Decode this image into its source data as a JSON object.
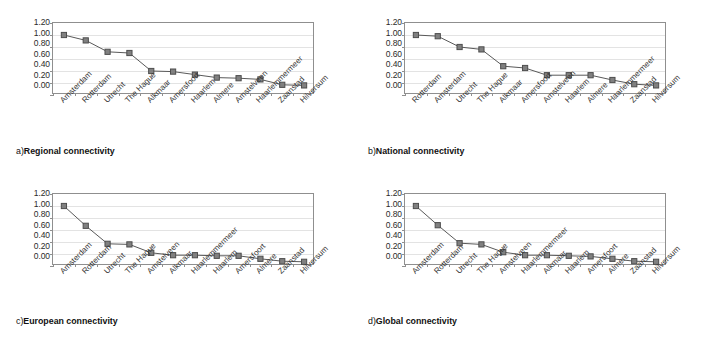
{
  "figure": {
    "marker_color": "#808080",
    "marker_edge_color": "#4d4d4d",
    "line_color": "#595959",
    "axis_color": "#8f8f8f",
    "gridline_color": "#e3e3e3",
    "background": "#ffffff"
  },
  "panels": [
    {
      "id": "panel-a",
      "caption_index": "a)",
      "caption_text": "Regional connectivity",
      "chart_data": {
        "type": "line",
        "title": "a) Regional connectivity",
        "xlabel": "",
        "ylabel": "",
        "ylim": [
          0.0,
          1.2
        ],
        "yticks": [
          "0.00",
          "0.20",
          "0.40",
          "0.60",
          "0.80",
          "1.00",
          "1.20"
        ],
        "grid": true,
        "legend": "none",
        "categories": [
          "Amsterdam",
          "Rotterdam",
          "Utrecht",
          "The Hague",
          "Alkmaar",
          "Amersfoort",
          "Haarlem",
          "Almere",
          "Amstelveen",
          "Haarlemmermeer",
          "Zaanstad",
          "Hilversum"
        ],
        "values": [
          1.0,
          0.91,
          0.72,
          0.7,
          0.4,
          0.39,
          0.34,
          0.29,
          0.28,
          0.26,
          0.17,
          0.16
        ]
      }
    },
    {
      "id": "panel-b",
      "caption_index": "b)",
      "caption_text": "National connectivity",
      "chart_data": {
        "type": "line",
        "title": "b) National connectivity",
        "xlabel": "",
        "ylabel": "",
        "ylim": [
          0.0,
          1.2
        ],
        "yticks": [
          "0.00",
          "0.20",
          "0.40",
          "0.60",
          "0.80",
          "1.00",
          "1.20"
        ],
        "grid": true,
        "legend": "none",
        "categories": [
          "Rotterdam",
          "Amsterdam",
          "Utrecht",
          "The Hague",
          "Alkmaar",
          "Amersfoort",
          "Amstelveen",
          "Haarlem",
          "Almere",
          "Haarlemmermeer",
          "Zaanstad",
          "Hilversum"
        ],
        "values": [
          1.0,
          0.98,
          0.8,
          0.76,
          0.48,
          0.45,
          0.33,
          0.33,
          0.33,
          0.25,
          0.18,
          0.16
        ]
      }
    },
    {
      "id": "panel-c",
      "caption_index": "c)",
      "caption_text": "European connectivity",
      "chart_data": {
        "type": "line",
        "title": "c) European connectivity",
        "xlabel": "",
        "ylabel": "",
        "ylim": [
          0.0,
          1.2
        ],
        "yticks": [
          "0.00",
          "0.20",
          "0.40",
          "0.60",
          "0.80",
          "1.00",
          "1.20"
        ],
        "grid": true,
        "legend": "none",
        "categories": [
          "Amsterdam",
          "Rotterdam",
          "Utrecht",
          "The Hague",
          "Amstelveen",
          "Alkmaar",
          "Haarlemmermeer",
          "Haarlem",
          "Amersfoort",
          "Almere",
          "Zaanstad",
          "Hilversum"
        ],
        "values": [
          1.0,
          0.67,
          0.37,
          0.36,
          0.22,
          0.18,
          0.18,
          0.17,
          0.17,
          0.12,
          0.08,
          0.07
        ]
      }
    },
    {
      "id": "panel-d",
      "caption_index": "d)",
      "caption_text": "Global connectivity",
      "chart_data": {
        "type": "line",
        "title": "d) Global connectivity",
        "xlabel": "",
        "ylabel": "",
        "ylim": [
          0.0,
          1.2
        ],
        "yticks": [
          "0.00",
          "0.20",
          "0.40",
          "0.60",
          "0.80",
          "1.00",
          "1.20"
        ],
        "grid": true,
        "legend": "none",
        "categories": [
          "Amsterdam",
          "Rotterdam",
          "Utrecht",
          "The Hague",
          "Amstelveen",
          "Haarlemmermeer",
          "Alkmaar",
          "Haarlem",
          "Amersfoort",
          "Almere",
          "Zaanstad",
          "Hilversum"
        ],
        "values": [
          1.0,
          0.68,
          0.38,
          0.36,
          0.23,
          0.18,
          0.18,
          0.17,
          0.16,
          0.12,
          0.08,
          0.07
        ]
      }
    }
  ]
}
